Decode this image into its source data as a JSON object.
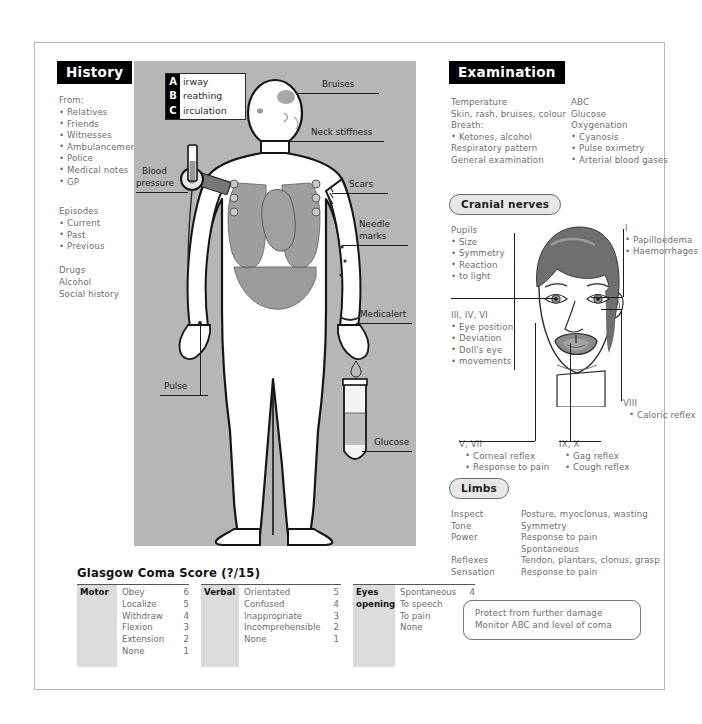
{
  "history": {
    "heading": "History",
    "from_label": "From:",
    "from_items": [
      "Relatives",
      "Friends",
      "Witnesses",
      "Ambulancemen",
      "Police",
      "Medical notes",
      "GP"
    ],
    "episodes_label": "Episodes",
    "episodes_items": [
      "Current",
      "Past",
      "Previous"
    ],
    "plain": [
      "Drugs",
      "Alcohol",
      "Social history"
    ]
  },
  "abc": {
    "letters": [
      "A",
      "B",
      "C"
    ],
    "words": [
      "irway",
      "reathing",
      "irculation"
    ]
  },
  "body_labels": {
    "bruises": "Bruises",
    "neck_stiffness": "Neck stiffness",
    "scars": "Scars",
    "needle_marks_1": "Needle",
    "needle_marks_2": "marks",
    "medicalert": "Medicalert",
    "glucose": "Glucose",
    "pulse": "Pulse",
    "blood_pressure_1": "Blood",
    "blood_pressure_2": "pressure"
  },
  "examination": {
    "heading": "Examination",
    "left": [
      "Temperature",
      "Skin, rash, bruises, colour",
      "Breath:"
    ],
    "left_bullets": [
      "Ketones, alcohol"
    ],
    "left_tail": [
      "Respiratory pattern",
      "General examination"
    ],
    "right": [
      "ABC",
      "Glucose",
      "Oxygenation"
    ],
    "right_bullets": [
      "Cyanosis",
      "Pulse oximetry",
      "Arterial blood gases"
    ]
  },
  "cranial": {
    "heading": "Cranial nerves",
    "pupils": {
      "title": "Pupils",
      "items": [
        "Size",
        "Symmetry",
        "Reaction",
        "to light"
      ]
    },
    "nerve_1": {
      "title": "I",
      "items": [
        "Papilloedema",
        "Haemorrhages"
      ]
    },
    "nerve_3_4_6": {
      "title": "III, IV, VI",
      "items": [
        "Eye position",
        "Deviation",
        "Doll's eye",
        "movements"
      ]
    },
    "nerve_8": {
      "title": "VIII",
      "items": [
        "Caloric reflex"
      ]
    },
    "nerve_5_7": {
      "title": "V, VII",
      "items": [
        "Corneal reflex",
        "Response to pain"
      ]
    },
    "nerve_9_10": {
      "title": "IX, X",
      "items": [
        "Gag reflex",
        "Cough reflex"
      ]
    }
  },
  "limbs": {
    "heading": "Limbs",
    "rows": [
      {
        "label": "Inspect",
        "value": "Posture, myoclonus, wasting"
      },
      {
        "label": "Tone",
        "value": "Symmetry"
      },
      {
        "label": "Power",
        "value": "Response to pain"
      },
      {
        "label": "",
        "value": "Spontaneous"
      },
      {
        "label": "Reflexes",
        "value": "Tendon, plantars, clonus, grasp"
      },
      {
        "label": "Sensation",
        "value": "Response to pain"
      }
    ]
  },
  "gcs": {
    "title": "Glasgow Coma Score (?/15)",
    "blocks": [
      {
        "label": "Motor",
        "rows": [
          {
            "name": "Obey",
            "score": "6"
          },
          {
            "name": "Localize",
            "score": "5"
          },
          {
            "name": "Withdraw",
            "score": "4"
          },
          {
            "name": "Flexion",
            "score": "3"
          },
          {
            "name": "Extension",
            "score": "2"
          },
          {
            "name": "None",
            "score": "1"
          }
        ]
      },
      {
        "label": "Verbal",
        "rows": [
          {
            "name": "Orientated",
            "score": "5"
          },
          {
            "name": "Confused",
            "score": "4"
          },
          {
            "name": "Inappropriate",
            "score": "3"
          },
          {
            "name": "Incomprehensible",
            "score": "2"
          },
          {
            "name": "None",
            "score": "1"
          }
        ]
      },
      {
        "label": "Eyes opening",
        "rows": [
          {
            "name": "Spontaneous",
            "score": "4"
          },
          {
            "name": "To speech",
            "score": "3"
          },
          {
            "name": "To pain",
            "score": "2"
          },
          {
            "name": "None",
            "score": "1"
          }
        ]
      }
    ]
  },
  "advice": {
    "line1": "Protect from further damage",
    "line2": "Monitor ABC and level of coma"
  },
  "colors": {
    "panel_gray": "#b6b6b6",
    "header_black": "#000000",
    "text_gray": "#6e6e6e",
    "organ_gray": "#8f8f8f",
    "hair_gray": "#6f6f6f"
  }
}
